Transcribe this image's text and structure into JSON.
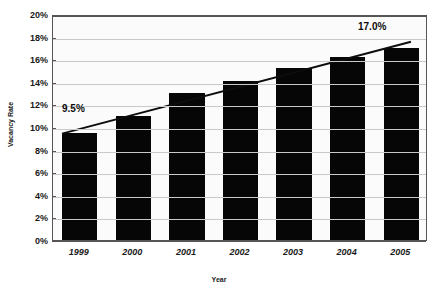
{
  "chart_data": {
    "type": "bar",
    "title": "",
    "xlabel": "Year",
    "ylabel": "Vacancy Rate",
    "categories": [
      "1999",
      "2000",
      "2001",
      "2002",
      "2003",
      "2004",
      "2005"
    ],
    "values": [
      9.5,
      11.0,
      13.0,
      14.1,
      15.2,
      16.2,
      17.0
    ],
    "ylim": [
      0,
      20
    ],
    "ytick_labels": [
      "0%",
      "2%",
      "4%",
      "6%",
      "8%",
      "10%",
      "12%",
      "14%",
      "16%",
      "18%",
      "20%"
    ],
    "ytick_values": [
      0,
      2,
      4,
      6,
      8,
      10,
      12,
      14,
      16,
      18,
      20
    ],
    "grid": true,
    "legend": "none",
    "series": [
      {
        "name": "Vacancy Rate",
        "values": [
          9.5,
          11.0,
          13.0,
          14.1,
          15.2,
          16.2,
          17.0
        ],
        "color": "#060606"
      }
    ],
    "trendline": {
      "type": "line",
      "start_value": 9.5,
      "end_value": 17.0,
      "color": "#0d0d0d"
    },
    "annotations": [
      {
        "text": "9.5%",
        "target": "1999",
        "value": 9.5
      },
      {
        "text": "17.0%",
        "target": "2005",
        "value": 17.0
      }
    ]
  },
  "colors": {
    "bar": "#060606",
    "grid": "#c9c9c9",
    "axis": "#555555",
    "plot_background": "#fbfbfb",
    "page_background": "#ffffff",
    "text": "#1a1a1a"
  }
}
